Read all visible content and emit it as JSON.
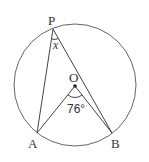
{
  "diagram": {
    "type": "circle-inscribed-angle",
    "points": {
      "P": {
        "label": "P"
      },
      "O": {
        "label": "O"
      },
      "A": {
        "label": "A"
      },
      "B": {
        "label": "B"
      }
    },
    "angles": {
      "central_AOB": {
        "label": "76°"
      },
      "inscribed_APB": {
        "label": "x"
      }
    },
    "colors": {
      "stroke": "#555555",
      "text": "#333333"
    }
  }
}
